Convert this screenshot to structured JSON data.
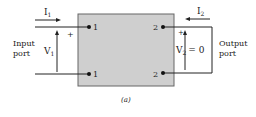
{
  "diagram": {
    "input": {
      "current": "I",
      "current_sub": "1",
      "voltage": "V",
      "voltage_sub": "1",
      "port_line1": "Input",
      "port_line2": "port",
      "plus": "+"
    },
    "output": {
      "current": "I",
      "current_sub": "2",
      "voltage": "V",
      "voltage_sub": "2",
      "voltage_eq": "= 0",
      "port_line1": "Output",
      "port_line2": "port",
      "plus": "+"
    },
    "terminals": {
      "left_top": "1",
      "left_bottom": "1",
      "right_top": "2",
      "right_bottom": "2"
    },
    "caption": "(a)",
    "colors": {
      "box_fill": "#cfcfcf",
      "box_stroke": "#555555",
      "line": "#222222"
    }
  }
}
